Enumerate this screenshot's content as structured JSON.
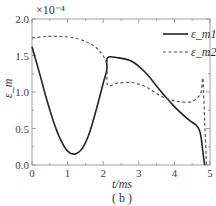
{
  "chart_data": {
    "type": "line",
    "title": "",
    "caption": "( b )",
    "xlabel": "t/ms",
    "ylabel": "ε_m",
    "y_multiplier": "×10⁻⁴",
    "xlim": [
      0,
      5
    ],
    "ylim": [
      0.0,
      2.0
    ],
    "x_ticks": [
      "0",
      "1",
      "2",
      "3",
      "4",
      "5"
    ],
    "y_ticks": [
      "0.0",
      "0.5",
      "1.0",
      "1.5",
      "2.0"
    ],
    "grid": false,
    "legend_position": "upper right",
    "series": [
      {
        "name": "ε_m1",
        "style": "solid",
        "x": [
          0,
          0.2,
          0.4,
          0.6,
          0.8,
          1.0,
          1.2,
          1.4,
          1.6,
          1.8,
          2.0,
          2.1,
          2.12,
          2.4,
          2.8,
          3.2,
          3.6,
          4.0,
          4.4,
          4.6,
          4.7,
          4.75,
          4.82,
          4.85
        ],
        "values": [
          1.62,
          1.28,
          0.92,
          0.6,
          0.35,
          0.19,
          0.15,
          0.22,
          0.42,
          0.75,
          1.12,
          1.3,
          1.47,
          1.47,
          1.42,
          1.26,
          1.02,
          0.8,
          0.62,
          0.55,
          0.48,
          0.38,
          0.1,
          0.0
        ]
      },
      {
        "name": "ε_m2",
        "style": "dashed",
        "x": [
          0,
          0.4,
          0.8,
          1.2,
          1.6,
          1.9,
          2.1,
          2.12,
          2.4,
          2.8,
          3.2,
          3.6,
          4.0,
          4.4,
          4.6,
          4.75,
          4.8,
          4.85,
          4.9
        ],
        "values": [
          1.74,
          1.76,
          1.76,
          1.74,
          1.67,
          1.56,
          1.38,
          1.1,
          1.12,
          1.13,
          1.07,
          0.95,
          0.88,
          0.86,
          0.9,
          1.0,
          1.18,
          0.6,
          0.0
        ]
      }
    ]
  }
}
